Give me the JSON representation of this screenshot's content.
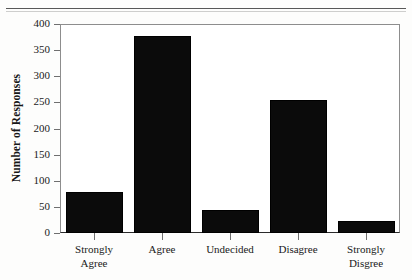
{
  "figure": {
    "top_rule": "horizontal-rule-artifact",
    "background_color": "#fdfdfc",
    "bar_color": "#0b0b0b",
    "frame_color": "#8d8d8d",
    "axis_color": "#2b2b2b"
  },
  "chart_data": {
    "type": "bar",
    "title": "",
    "xlabel": "",
    "ylabel": "Number of Responses",
    "categories": [
      "Strongly\nAgree",
      "Agree",
      "Undecided",
      "Disagree",
      "Strongly\nDisgree"
    ],
    "values": [
      78,
      377,
      44,
      255,
      23
    ],
    "ylim": [
      0,
      400
    ],
    "yticks": [
      0,
      50,
      100,
      150,
      200,
      250,
      300,
      350,
      400
    ],
    "ytick_labels": [
      "0",
      "50",
      "100",
      "150",
      "200",
      "250",
      "300",
      "350",
      "400"
    ],
    "grid": false,
    "legend": null
  }
}
